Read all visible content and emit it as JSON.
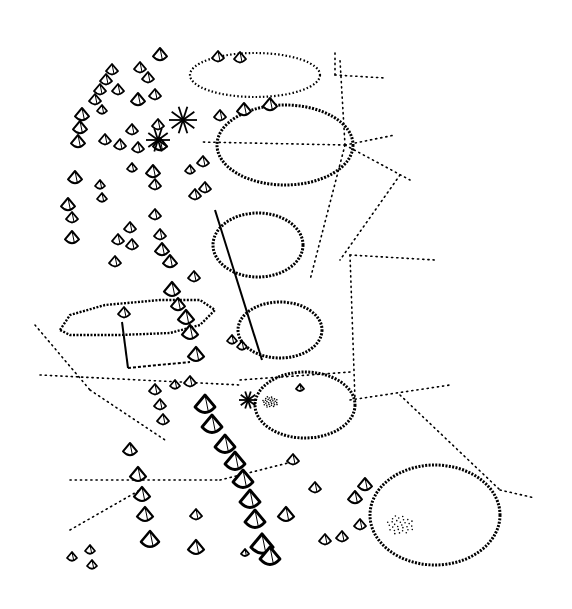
{
  "drawing": {
    "background": "#ffffff",
    "ink": "#000000",
    "width": 572,
    "height": 609
  },
  "ponds": [
    {
      "cx": 255,
      "cy": 75,
      "rx": 65,
      "ry": 22,
      "weight": "light"
    },
    {
      "cx": 285,
      "cy": 145,
      "rx": 68,
      "ry": 40,
      "weight": "heavy"
    },
    {
      "cx": 258,
      "cy": 245,
      "rx": 45,
      "ry": 32,
      "weight": "heavy"
    },
    {
      "cx": 280,
      "cy": 330,
      "rx": 42,
      "ry": 28,
      "weight": "heavy"
    },
    {
      "cx": 305,
      "cy": 405,
      "rx": 50,
      "ry": 33,
      "weight": "heavy"
    },
    {
      "cx": 435,
      "cy": 515,
      "rx": 65,
      "ry": 50,
      "weight": "heavy"
    }
  ],
  "terrace": {
    "points": "60,330 70,315 105,305 160,300 200,300 215,310 200,325 170,333 120,335 70,335"
  },
  "sight_lines": [
    {
      "x1": 345,
      "y1": 145,
      "x2": 395,
      "y2": 135
    },
    {
      "x1": 345,
      "y1": 145,
      "x2": 410,
      "y2": 180
    },
    {
      "x1": 345,
      "y1": 145,
      "x2": 310,
      "y2": 280
    },
    {
      "x1": 345,
      "y1": 145,
      "x2": 340,
      "y2": 60
    },
    {
      "x1": 345,
      "y1": 145,
      "x2": 200,
      "y2": 142
    },
    {
      "x1": 335,
      "y1": 75,
      "x2": 385,
      "y2": 78
    },
    {
      "x1": 335,
      "y1": 75,
      "x2": 335,
      "y2": 50
    },
    {
      "x1": 400,
      "y1": 175,
      "x2": 340,
      "y2": 260
    },
    {
      "x1": 350,
      "y1": 255,
      "x2": 435,
      "y2": 260
    },
    {
      "x1": 350,
      "y1": 255,
      "x2": 355,
      "y2": 400
    },
    {
      "x1": 350,
      "y1": 400,
      "x2": 450,
      "y2": 385
    },
    {
      "x1": 400,
      "y1": 395,
      "x2": 500,
      "y2": 490
    },
    {
      "x1": 500,
      "y1": 490,
      "x2": 535,
      "y2": 498
    },
    {
      "x1": 35,
      "y1": 325,
      "x2": 90,
      "y2": 390
    },
    {
      "x1": 40,
      "y1": 375,
      "x2": 240,
      "y2": 385
    },
    {
      "x1": 90,
      "y1": 390,
      "x2": 165,
      "y2": 440
    },
    {
      "x1": 70,
      "y1": 480,
      "x2": 220,
      "y2": 480
    },
    {
      "x1": 70,
      "y1": 530,
      "x2": 140,
      "y2": 490
    },
    {
      "x1": 220,
      "y1": 480,
      "x2": 300,
      "y2": 460
    },
    {
      "x1": 240,
      "y1": 380,
      "x2": 350,
      "y2": 372
    }
  ],
  "trees": [
    {
      "x": 160,
      "y": 55,
      "s": 7
    },
    {
      "x": 218,
      "y": 57,
      "s": 6
    },
    {
      "x": 240,
      "y": 58,
      "s": 6
    },
    {
      "x": 112,
      "y": 70,
      "s": 6
    },
    {
      "x": 106,
      "y": 80,
      "s": 6
    },
    {
      "x": 100,
      "y": 90,
      "s": 6
    },
    {
      "x": 95,
      "y": 100,
      "s": 6
    },
    {
      "x": 140,
      "y": 68,
      "s": 6
    },
    {
      "x": 148,
      "y": 78,
      "s": 6
    },
    {
      "x": 118,
      "y": 90,
      "s": 6
    },
    {
      "x": 138,
      "y": 100,
      "s": 7
    },
    {
      "x": 155,
      "y": 95,
      "s": 6
    },
    {
      "x": 82,
      "y": 115,
      "s": 7
    },
    {
      "x": 80,
      "y": 128,
      "s": 7
    },
    {
      "x": 78,
      "y": 142,
      "s": 7
    },
    {
      "x": 102,
      "y": 110,
      "s": 5
    },
    {
      "x": 105,
      "y": 140,
      "s": 6
    },
    {
      "x": 120,
      "y": 145,
      "s": 6
    },
    {
      "x": 132,
      "y": 130,
      "s": 6
    },
    {
      "x": 138,
      "y": 148,
      "s": 6
    },
    {
      "x": 158,
      "y": 125,
      "s": 6
    },
    {
      "x": 160,
      "y": 145,
      "s": 7
    },
    {
      "x": 132,
      "y": 168,
      "s": 5
    },
    {
      "x": 153,
      "y": 172,
      "s": 7
    },
    {
      "x": 155,
      "y": 185,
      "s": 6
    },
    {
      "x": 220,
      "y": 116,
      "s": 6
    },
    {
      "x": 244,
      "y": 110,
      "s": 7
    },
    {
      "x": 270,
      "y": 105,
      "s": 7
    },
    {
      "x": 203,
      "y": 162,
      "s": 6
    },
    {
      "x": 190,
      "y": 170,
      "s": 5
    },
    {
      "x": 195,
      "y": 195,
      "s": 6
    },
    {
      "x": 205,
      "y": 188,
      "s": 6
    },
    {
      "x": 75,
      "y": 178,
      "s": 7
    },
    {
      "x": 100,
      "y": 185,
      "s": 5
    },
    {
      "x": 102,
      "y": 198,
      "s": 5
    },
    {
      "x": 68,
      "y": 205,
      "s": 7
    },
    {
      "x": 72,
      "y": 218,
      "s": 6
    },
    {
      "x": 72,
      "y": 238,
      "s": 7
    },
    {
      "x": 130,
      "y": 228,
      "s": 6
    },
    {
      "x": 118,
      "y": 240,
      "s": 6
    },
    {
      "x": 132,
      "y": 245,
      "s": 6
    },
    {
      "x": 155,
      "y": 215,
      "s": 6
    },
    {
      "x": 160,
      "y": 235,
      "s": 6
    },
    {
      "x": 162,
      "y": 250,
      "s": 7
    },
    {
      "x": 170,
      "y": 262,
      "s": 7
    },
    {
      "x": 115,
      "y": 262,
      "s": 6
    },
    {
      "x": 194,
      "y": 277,
      "s": 6
    },
    {
      "x": 172,
      "y": 290,
      "s": 8
    },
    {
      "x": 178,
      "y": 305,
      "s": 7
    },
    {
      "x": 124,
      "y": 313,
      "s": 6
    },
    {
      "x": 186,
      "y": 318,
      "s": 8
    },
    {
      "x": 190,
      "y": 333,
      "s": 8
    },
    {
      "x": 196,
      "y": 355,
      "s": 8
    },
    {
      "x": 232,
      "y": 340,
      "s": 5
    },
    {
      "x": 242,
      "y": 346,
      "s": 5
    },
    {
      "x": 175,
      "y": 385,
      "s": 5
    },
    {
      "x": 190,
      "y": 382,
      "s": 6
    },
    {
      "x": 155,
      "y": 390,
      "s": 6
    },
    {
      "x": 160,
      "y": 405,
      "s": 6
    },
    {
      "x": 163,
      "y": 420,
      "s": 6
    },
    {
      "x": 205,
      "y": 405,
      "s": 10
    },
    {
      "x": 212,
      "y": 425,
      "s": 10
    },
    {
      "x": 225,
      "y": 445,
      "s": 10
    },
    {
      "x": 235,
      "y": 462,
      "s": 10
    },
    {
      "x": 243,
      "y": 480,
      "s": 10
    },
    {
      "x": 250,
      "y": 500,
      "s": 10
    },
    {
      "x": 255,
      "y": 520,
      "s": 10
    },
    {
      "x": 262,
      "y": 545,
      "s": 11
    },
    {
      "x": 270,
      "y": 557,
      "s": 10
    },
    {
      "x": 286,
      "y": 515,
      "s": 8
    },
    {
      "x": 130,
      "y": 450,
      "s": 7
    },
    {
      "x": 138,
      "y": 475,
      "s": 8
    },
    {
      "x": 142,
      "y": 495,
      "s": 8
    },
    {
      "x": 145,
      "y": 515,
      "s": 8
    },
    {
      "x": 150,
      "y": 540,
      "s": 9
    },
    {
      "x": 196,
      "y": 515,
      "s": 6
    },
    {
      "x": 196,
      "y": 548,
      "s": 8
    },
    {
      "x": 245,
      "y": 553,
      "s": 4
    },
    {
      "x": 72,
      "y": 557,
      "s": 5
    },
    {
      "x": 90,
      "y": 550,
      "s": 5
    },
    {
      "x": 92,
      "y": 565,
      "s": 5
    },
    {
      "x": 293,
      "y": 460,
      "s": 6
    },
    {
      "x": 315,
      "y": 488,
      "s": 6
    },
    {
      "x": 355,
      "y": 498,
      "s": 7
    },
    {
      "x": 365,
      "y": 485,
      "s": 7
    },
    {
      "x": 360,
      "y": 525,
      "s": 6
    },
    {
      "x": 342,
      "y": 537,
      "s": 6
    },
    {
      "x": 325,
      "y": 540,
      "s": 6
    },
    {
      "x": 300,
      "y": 388,
      "s": 4
    }
  ],
  "conifers": [
    {
      "x": 183,
      "y": 120,
      "s": 14
    },
    {
      "x": 158,
      "y": 140,
      "s": 12
    },
    {
      "x": 248,
      "y": 400,
      "s": 9
    }
  ],
  "stipple_areas": [
    {
      "cx": 400,
      "cy": 525,
      "r": 14
    },
    {
      "cx": 270,
      "cy": 402,
      "r": 8
    }
  ]
}
